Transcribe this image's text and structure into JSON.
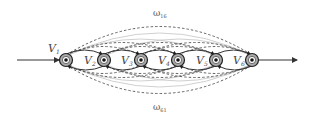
{
  "diagram": {
    "type": "chain-graph",
    "nodes": [
      {
        "id": "V1",
        "label": "V",
        "sub": "1",
        "x": 66,
        "y": 60
      },
      {
        "id": "V2",
        "label": "V",
        "sub": "2",
        "x": 104,
        "y": 60
      },
      {
        "id": "V3",
        "label": "V",
        "sub": "3",
        "x": 141,
        "y": 60
      },
      {
        "id": "V4",
        "label": "V",
        "sub": "4",
        "x": 178,
        "y": 60
      },
      {
        "id": "V5",
        "label": "V",
        "sub": "5",
        "x": 216,
        "y": 60
      },
      {
        "id": "V6",
        "label": "V",
        "sub": "6",
        "x": 252,
        "y": 60
      }
    ],
    "edge_labels": {
      "top": {
        "symbol": "ω",
        "sub": "16"
      },
      "bottom": {
        "symbol": "ω",
        "sub": "61"
      }
    },
    "input_arrow": "in",
    "output_arrow": "out",
    "colors": {
      "node_ring": "#999999",
      "node_core": "#222222",
      "solid_edge": "#333333",
      "dashed_edge": "#555555",
      "light_edge": "#bbbbbb"
    }
  }
}
